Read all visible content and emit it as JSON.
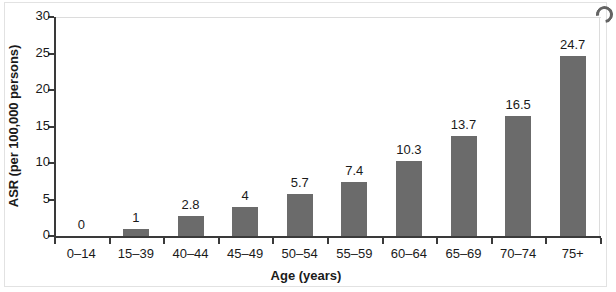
{
  "chart_data": {
    "type": "bar",
    "title": "",
    "subtitle": "",
    "xlabel": "Age (years)",
    "ylabel": "ASR (per 100,000 persons)",
    "categories": [
      "0–14",
      "15–39",
      "40–44",
      "45–49",
      "50–54",
      "55–59",
      "60–64",
      "65–69",
      "70–74",
      "75+"
    ],
    "values": [
      0,
      1,
      2.8,
      4,
      5.7,
      7.4,
      10.3,
      13.7,
      16.5,
      24.7
    ],
    "value_labels": [
      "0",
      "1",
      "2.8",
      "4",
      "5.7",
      "7.4",
      "10.3",
      "13.7",
      "16.5",
      "24.7"
    ],
    "ylim": [
      0,
      30
    ],
    "ytick_values": [
      0,
      5,
      10,
      15,
      20,
      25,
      30
    ],
    "ytick_labels": [
      "0",
      "5",
      "10",
      "15",
      "20",
      "25",
      "30"
    ],
    "grid": false,
    "legend": "none",
    "bar_color": "#6b6b6b",
    "axis_color": "#3a3a3a",
    "text_color": "#1a1a1a"
  },
  "artifacts": {
    "page_border": "scanned-page-border",
    "smudge": "scan-smudge-top-right"
  }
}
